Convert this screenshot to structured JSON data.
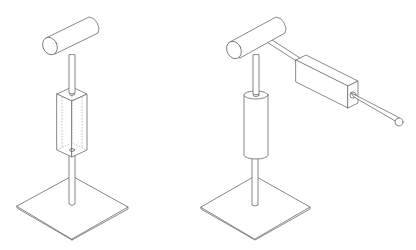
{
  "figure": {
    "panels": [
      {
        "id": "left",
        "description": "T-handle on vertical rod passing through transparent square block, mounted on square base plate",
        "parts": [
          "cylindrical-handle",
          "vertical-rod",
          "square-block-transparent",
          "base-plate"
        ]
      },
      {
        "id": "right",
        "description": "T-handle with horizontal arm rod through rectangular block ending in ball tip, vertical rod through cylindrical sleeve, mounted on square base plate",
        "parts": [
          "cylindrical-handle",
          "horizontal-arm-rod",
          "rectangular-block",
          "ball-tip",
          "vertical-rod",
          "cylindrical-sleeve",
          "base-plate"
        ]
      }
    ],
    "colors": {
      "line": "#6a6a6a",
      "background": "#ffffff"
    }
  }
}
